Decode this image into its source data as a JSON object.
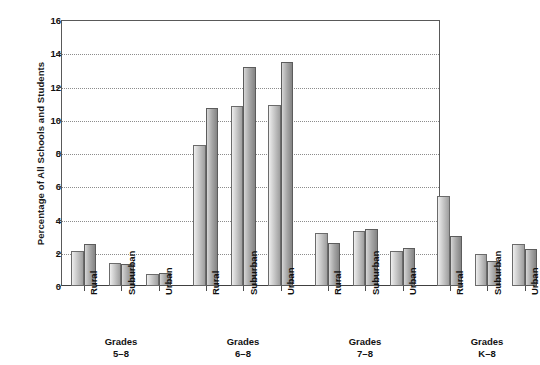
{
  "chart_data": {
    "type": "bar",
    "title": "",
    "subtitle": "",
    "xlabel": "",
    "ylabel": "Percentage of All Schools and Students",
    "ylim": [
      0,
      16
    ],
    "ytick_step": 2,
    "yticks": [
      "16",
      "14",
      "12",
      "10",
      "8",
      "6",
      "4",
      "2",
      "0"
    ],
    "grid": true,
    "grid_axis": "y",
    "legend_position": "none",
    "series": [
      {
        "name": "Schools",
        "shade": "light"
      },
      {
        "name": "Students",
        "shade": "dark"
      }
    ],
    "groups": [
      {
        "label_line1": "Grades",
        "label_line2": "5–8",
        "categories": [
          "Rural",
          "Suburban",
          "Urban"
        ],
        "values": [
          [
            2.1,
            2.5
          ],
          [
            1.4,
            1.3
          ],
          [
            0.7,
            0.8
          ]
        ]
      },
      {
        "label_line1": "Grades",
        "label_line2": "6–8",
        "categories": [
          "Rural",
          "Suburban",
          "Urban"
        ],
        "values": [
          [
            8.5,
            10.7
          ],
          [
            10.8,
            13.2
          ],
          [
            10.9,
            13.5
          ]
        ]
      },
      {
        "label_line1": "Grades",
        "label_line2": "7–8",
        "categories": [
          "Rural",
          "Suburban",
          "Urban"
        ],
        "values": [
          [
            3.2,
            2.6
          ],
          [
            3.3,
            3.4
          ],
          [
            2.1,
            2.3
          ]
        ]
      },
      {
        "label_line1": "Grades",
        "label_line2": "K–8",
        "categories": [
          "Rural",
          "Suburban",
          "Urban"
        ],
        "values": [
          [
            5.4,
            3.0
          ],
          [
            1.9,
            1.5
          ],
          [
            2.5,
            2.2
          ]
        ]
      }
    ]
  },
  "colors": {
    "bar_light_start": "#efefef",
    "bar_light_end": "#9e9e9e",
    "bar_dark_start": "#d8d8d8",
    "bar_dark_end": "#848484",
    "bar_border": "#6b6b6b",
    "grid": "#8c8c8c",
    "axis": "#4d4d4d",
    "text": "#111111",
    "background": "#ffffff"
  }
}
